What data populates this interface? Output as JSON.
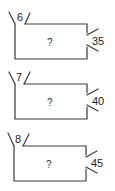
{
  "figures": [
    {
      "top_label": "6",
      "center_label": "?",
      "side_label": "35"
    },
    {
      "top_label": "7",
      "center_label": "?",
      "side_label": "40"
    },
    {
      "top_label": "8",
      "center_label": "?",
      "side_label": "45"
    }
  ]
}
